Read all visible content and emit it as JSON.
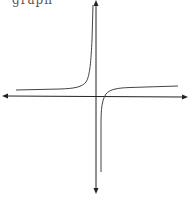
{
  "caption": {
    "text": "graph"
  },
  "figure": {
    "axes": {
      "x_arrows": "both",
      "y_arrows": "both"
    },
    "branches": [
      {
        "name": "left-branch",
        "behavior": "approaches horizontal asymptote from left, rises to +infinity near vertical asymptote"
      },
      {
        "name": "right-branch",
        "behavior": "rises from -infinity near vertical asymptote, approaches horizontal asymptote to the right"
      }
    ],
    "colors": {
      "axis": "#222222",
      "curve": "#444444",
      "background": "#ffffff"
    }
  }
}
